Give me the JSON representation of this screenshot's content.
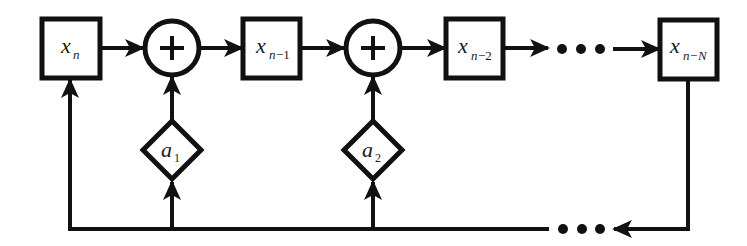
{
  "diagram": {
    "type": "feedback-shift-register",
    "stroke_color": "#111111",
    "background": "#ffffff",
    "registers": [
      {
        "id": "xn",
        "var": "x",
        "sub": "n",
        "sub_style": "italic"
      },
      {
        "id": "xn1",
        "var": "x",
        "sub": "n",
        "sub_suffix": "−1"
      },
      {
        "id": "xn2",
        "var": "x",
        "sub": "n",
        "sub_suffix": "−2"
      },
      {
        "id": "xnN",
        "var": "x",
        "sub": "n",
        "sub_suffix": "−N"
      }
    ],
    "adders": [
      {
        "id": "add1",
        "symbol": "+"
      },
      {
        "id": "add2",
        "symbol": "+"
      }
    ],
    "coefficients": [
      {
        "id": "a1",
        "var": "a",
        "sub": "1"
      },
      {
        "id": "a2",
        "var": "a",
        "sub": "2"
      }
    ],
    "ellipsis_top": "•••",
    "ellipsis_bottom": "•••"
  }
}
